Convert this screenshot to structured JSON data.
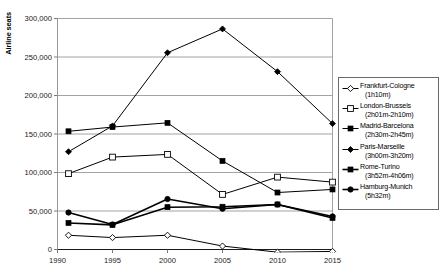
{
  "chart_data": {
    "type": "line",
    "title": "",
    "xlabel": "",
    "ylabel": "Airline seats",
    "x": [
      1991,
      1995,
      2000,
      2005,
      2010,
      2015
    ],
    "xtick_labels": [
      "1990",
      "1995",
      "2000",
      "2005",
      "2010",
      "2015"
    ],
    "xtick_values": [
      1990,
      1995,
      2000,
      2005,
      2010,
      2015
    ],
    "ytick_labels": [
      "0",
      "50,000",
      "100,000",
      "150,000",
      "200,000",
      "250,000",
      "300,000"
    ],
    "ytick_values": [
      0,
      50000,
      100000,
      150000,
      200000,
      250000,
      300000
    ],
    "xlim": [
      1990,
      2015
    ],
    "ylim": [
      0,
      300000
    ],
    "grid": true,
    "legend_position": "right",
    "series": [
      {
        "name": "Frankfurt-Cologne",
        "duration": "(1h10m)",
        "marker": "open-diamond",
        "values": [
          18500,
          15500,
          18500,
          4500,
          -3500,
          -2500
        ]
      },
      {
        "name": "London-Brussels",
        "duration": "(2h01m-2h10m)",
        "marker": "open-square",
        "values": [
          98500,
          120000,
          123500,
          71500,
          94000,
          87500
        ]
      },
      {
        "name": "Madrid-Barcelona",
        "duration": "(2h30m-2h45m)",
        "marker": "filled-square",
        "values": [
          153500,
          159000,
          164500,
          115000,
          74000,
          78000
        ]
      },
      {
        "name": "Paris-Marseille",
        "duration": "(3h00m-3h20m)",
        "marker": "filled-diamond",
        "values": [
          127000,
          160500,
          255500,
          286500,
          231000,
          163500
        ]
      },
      {
        "name": "Rome-Turino",
        "duration": "(3h52m-4h06m)",
        "marker": "filled-square-bold",
        "values": [
          34500,
          32000,
          55000,
          55500,
          58500,
          41000
        ]
      },
      {
        "name": "Hamburg-Munich",
        "duration": "(5h32m)",
        "marker": "filled-circle",
        "values": [
          48000,
          32500,
          65500,
          53000,
          58500,
          43000
        ]
      }
    ]
  },
  "axis": {
    "y_title": "Airline seats"
  }
}
